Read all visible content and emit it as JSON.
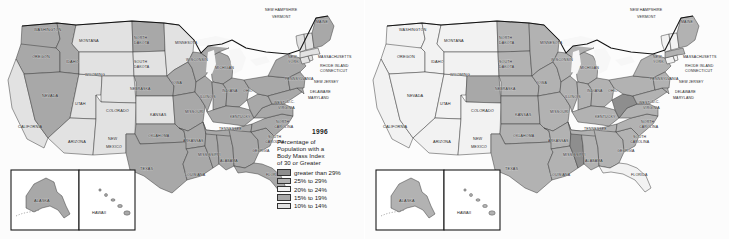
{
  "figure": {
    "panel_count": 2,
    "background_color": "#fdfdfd"
  },
  "palette": {
    "greater_than_29": "#8e8e8e",
    "p25_29": "#b2b2b2",
    "p20_24": "#f2f2f2",
    "p15_19": "#a8a8a8",
    "p10_14": "#e2e2e2",
    "ocean": "#fbfbfb",
    "lake": "#f7f7f7",
    "border": "#3a3a3a",
    "outline": "#141414",
    "text": "#1b1b1b"
  },
  "legend": {
    "title_prefix": "Percentage of",
    "description_lines": [
      "Percentage of",
      "Population with a",
      "Body Mass Index",
      "of 30 or Greater"
    ],
    "rows": [
      {
        "label": "greater than 29%",
        "color": "#8e8e8e",
        "key": "greater_than_29"
      },
      {
        "label": "25% to 29%",
        "color": "#b2b2b2",
        "key": "p25_29"
      },
      {
        "label": "20% to 24%",
        "color": "#f2f2f2",
        "key": "p20_24"
      },
      {
        "label": "15% to 19%",
        "color": "#a8a8a8",
        "key": "p15_19"
      },
      {
        "label": "10% to 14%",
        "color": "#e2e2e2",
        "key": "p10_14"
      }
    ]
  },
  "maps": [
    {
      "id": "map-1996",
      "year": "1996",
      "position": "left",
      "inset_labels": {
        "alaska": "ALASKA",
        "hawaii": "HAWAII"
      }
    },
    {
      "id": "map-2006",
      "year": "2006",
      "position": "right",
      "inset_labels": {
        "alaska": "ALASKA",
        "hawaii": "HAWAII"
      }
    }
  ],
  "chart_data": {
    "type": "heatmap",
    "title": "Percentage of Population with a Body Mass Index of 30 or Greater",
    "subtitle": "United States choropleth maps, 1996 and 2006",
    "xlabel": "",
    "ylabel": "",
    "legend_position": "right",
    "grid": false,
    "categories": [
      "greater than 29%",
      "25% to 29%",
      "20% to 24%",
      "15% to 19%",
      "10% to 14%"
    ],
    "series": [
      {
        "name": "1996",
        "values": {
          "WASHINGTON": "15% to 19%",
          "OREGON": "15% to 19%",
          "CALIFORNIA": "10% to 14%",
          "IDAHO": "15% to 19%",
          "NEVADA": "15% to 19%",
          "UTAH": "10% to 14%",
          "ARIZONA": "10% to 14%",
          "MONTANA": "10% to 14%",
          "WYOMING": "10% to 14%",
          "COLORADO": "10% to 14%",
          "NEW MEXICO": "10% to 14%",
          "NORTH DAKOTA": "15% to 19%",
          "SOUTH DAKOTA": "10% to 14%",
          "NEBRASKA": "15% to 19%",
          "KANSAS": "10% to 14%",
          "OKLAHOMA": "15% to 19%",
          "TEXAS": "15% to 19%",
          "MINNESOTA": "10% to 14%",
          "IOWA": "15% to 19%",
          "MISSOURI": "15% to 19%",
          "ARKANSAS": "15% to 19%",
          "LOUISIANA": "15% to 19%",
          "WISCONSIN": "15% to 19%",
          "ILLINOIS": "15% to 19%",
          "MICHIGAN": "15% to 19%",
          "INDIANA": "15% to 19%",
          "OHIO": "15% to 19%",
          "KENTUCKY": "15% to 19%",
          "TENNESSEE": "15% to 19%",
          "MISSISSIPPI": "15% to 19%",
          "ALABAMA": "15% to 19%",
          "GEORGIA": "15% to 19%",
          "FLORIDA": "15% to 19%",
          "SOUTH CAROLINA": "15% to 19%",
          "NORTH CAROLINA": "15% to 19%",
          "VIRGINIA": "15% to 19%",
          "WEST VIRGINIA": "15% to 19%",
          "MARYLAND": "15% to 19%",
          "DELAWARE": "15% to 19%",
          "PENNSYLVANIA": "15% to 19%",
          "NEW JERSEY": "15% to 19%",
          "NEW YORK": "15% to 19%",
          "CONNECTICUT": "10% to 14%",
          "RHODE ISLAND": "10% to 14%",
          "MASSACHUSETTS": "10% to 14%",
          "VERMONT": "10% to 14%",
          "NEW HAMPSHIRE": "10% to 14%",
          "MAINE": "15% to 19%",
          "ALASKA": "15% to 19%",
          "HAWAII": "10% to 14%"
        }
      },
      {
        "name": "2006",
        "values": {
          "WASHINGTON": "20% to 24%",
          "OREGON": "20% to 24%",
          "CALIFORNIA": "20% to 24%",
          "IDAHO": "20% to 24%",
          "NEVADA": "20% to 24%",
          "UTAH": "20% to 24%",
          "ARIZONA": "20% to 24%",
          "MONTANA": "20% to 24%",
          "WYOMING": "20% to 24%",
          "COLORADO": "15% to 19%",
          "NEW MEXICO": "20% to 24%",
          "NORTH DAKOTA": "25% to 29%",
          "SOUTH DAKOTA": "25% to 29%",
          "NEBRASKA": "25% to 29%",
          "KANSAS": "25% to 29%",
          "OKLAHOMA": "25% to 29%",
          "TEXAS": "25% to 29%",
          "MINNESOTA": "25% to 29%",
          "IOWA": "25% to 29%",
          "MISSOURI": "25% to 29%",
          "ARKANSAS": "25% to 29%",
          "LOUISIANA": "25% to 29%",
          "WISCONSIN": "25% to 29%",
          "ILLINOIS": "25% to 29%",
          "MICHIGAN": "25% to 29%",
          "INDIANA": "25% to 29%",
          "OHIO": "25% to 29%",
          "KENTUCKY": "25% to 29%",
          "TENNESSEE": "25% to 29%",
          "MISSISSIPPI": "greater than 29%",
          "ALABAMA": "25% to 29%",
          "GEORGIA": "25% to 29%",
          "FLORIDA": "20% to 24%",
          "SOUTH CAROLINA": "25% to 29%",
          "NORTH CAROLINA": "25% to 29%",
          "VIRGINIA": "25% to 29%",
          "WEST VIRGINIA": "greater than 29%",
          "MARYLAND": "25% to 29%",
          "DELAWARE": "25% to 29%",
          "PENNSYLVANIA": "25% to 29%",
          "NEW JERSEY": "25% to 29%",
          "NEW YORK": "25% to 29%",
          "CONNECTICUT": "20% to 24%",
          "RHODE ISLAND": "20% to 24%",
          "MASSACHUSETTS": "25% to 29%",
          "VERMONT": "20% to 24%",
          "NEW HAMPSHIRE": "20% to 24%",
          "MAINE": "25% to 29%",
          "ALASKA": "25% to 29%",
          "HAWAII": "20% to 24%"
        }
      }
    ]
  },
  "state_labels": [
    {
      "name": "WASHINGTON",
      "x": 34,
      "y": 31,
      "size": "mid"
    },
    {
      "name": "MONTANA",
      "x": 79,
      "y": 42,
      "size": "mid"
    },
    {
      "name": "NORTH",
      "x": 134,
      "y": 39,
      "size": "tiny"
    },
    {
      "name": "DAKOTA",
      "x": 134,
      "y": 44,
      "size": "tiny"
    },
    {
      "name": "MINNESOTA",
      "x": 175,
      "y": 44,
      "size": "tiny"
    },
    {
      "name": "OREGON",
      "x": 32,
      "y": 58,
      "size": "mid"
    },
    {
      "name": "IDAHO",
      "x": 66,
      "y": 63,
      "size": "mid"
    },
    {
      "name": "WYOMING",
      "x": 85,
      "y": 76,
      "size": "mid"
    },
    {
      "name": "SOUTH",
      "x": 134,
      "y": 63,
      "size": "tiny"
    },
    {
      "name": "DAKOTA",
      "x": 134,
      "y": 68,
      "size": "tiny"
    },
    {
      "name": "WISCONSIN",
      "x": 186,
      "y": 61,
      "size": "tiny"
    },
    {
      "name": "MICHIGAN",
      "x": 215,
      "y": 69,
      "size": "tiny"
    },
    {
      "name": "NEW",
      "x": 288,
      "y": 58,
      "size": "tiny"
    },
    {
      "name": "YORK",
      "x": 288,
      "y": 63,
      "size": "tiny"
    },
    {
      "name": "MASSACHUSETTS",
      "x": 318,
      "y": 58,
      "size": "tiny"
    },
    {
      "name": "RHODE ISLAND",
      "x": 320,
      "y": 67,
      "size": "tiny"
    },
    {
      "name": "CONNECTICUT",
      "x": 320,
      "y": 72,
      "size": "tiny"
    },
    {
      "name": "NEW HAMPSHIRE",
      "x": 265,
      "y": 11,
      "size": "tiny"
    },
    {
      "name": "VERMONT",
      "x": 272,
      "y": 18,
      "size": "tiny"
    },
    {
      "name": "MAINE",
      "x": 316,
      "y": 23,
      "size": "tiny"
    },
    {
      "name": "NEBRASKA",
      "x": 130,
      "y": 90,
      "size": "tiny"
    },
    {
      "name": "IOWA",
      "x": 172,
      "y": 84,
      "size": "tiny"
    },
    {
      "name": "PENNSYLVANIA",
      "x": 285,
      "y": 80,
      "size": "tiny"
    },
    {
      "name": "NEVADA",
      "x": 42,
      "y": 97,
      "size": "mid"
    },
    {
      "name": "UTAH",
      "x": 75,
      "y": 105,
      "size": "mid"
    },
    {
      "name": "COLORADO",
      "x": 106,
      "y": 112,
      "size": "mid"
    },
    {
      "name": "KANSAS",
      "x": 150,
      "y": 116,
      "size": "mid"
    },
    {
      "name": "MISSOURI",
      "x": 185,
      "y": 113,
      "size": "tiny"
    },
    {
      "name": "ILLINOIS",
      "x": 200,
      "y": 98,
      "size": "tiny"
    },
    {
      "name": "INDIANA",
      "x": 222,
      "y": 92,
      "size": "tiny"
    },
    {
      "name": "OHIO",
      "x": 243,
      "y": 92,
      "size": "tiny"
    },
    {
      "name": "NEW JERSEY",
      "x": 314,
      "y": 83,
      "size": "tiny"
    },
    {
      "name": "DELAWARE",
      "x": 310,
      "y": 93,
      "size": "tiny"
    },
    {
      "name": "MARYLAND",
      "x": 308,
      "y": 99,
      "size": "tiny"
    },
    {
      "name": "D.C.",
      "x": 287,
      "y": 103,
      "size": "tiny"
    },
    {
      "name": "WEST",
      "x": 274,
      "y": 104,
      "size": "tiny"
    },
    {
      "name": "VIRGINIA",
      "x": 278,
      "y": 109,
      "size": "tiny"
    },
    {
      "name": "CALIFORNIA",
      "x": 18,
      "y": 128,
      "size": "mid"
    },
    {
      "name": "ARIZONA",
      "x": 68,
      "y": 143,
      "size": "mid"
    },
    {
      "name": "NEW",
      "x": 108,
      "y": 140,
      "size": "mid"
    },
    {
      "name": "MEXICO",
      "x": 106,
      "y": 148,
      "size": "mid"
    },
    {
      "name": "OKLAHOMA",
      "x": 148,
      "y": 137,
      "size": "tiny"
    },
    {
      "name": "ARKANSAS",
      "x": 183,
      "y": 142,
      "size": "tiny"
    },
    {
      "name": "TENNESSEE",
      "x": 219,
      "y": 130,
      "size": "tiny"
    },
    {
      "name": "KENTUCKY",
      "x": 230,
      "y": 118,
      "size": "tiny"
    },
    {
      "name": "NORTH",
      "x": 276,
      "y": 123,
      "size": "tiny"
    },
    {
      "name": "CAROLINA",
      "x": 274,
      "y": 128,
      "size": "tiny"
    },
    {
      "name": "SOUTH",
      "x": 268,
      "y": 138,
      "size": "tiny"
    },
    {
      "name": "CAROLINA",
      "x": 265,
      "y": 143,
      "size": "tiny"
    },
    {
      "name": "GEORGIA",
      "x": 252,
      "y": 152,
      "size": "tiny"
    },
    {
      "name": "MISSISSIPPI",
      "x": 198,
      "y": 156,
      "size": "tiny"
    },
    {
      "name": "ALABAMA",
      "x": 220,
      "y": 162,
      "size": "tiny"
    },
    {
      "name": "TEXAS",
      "x": 140,
      "y": 170,
      "size": "mid"
    },
    {
      "name": "LOUISIANA",
      "x": 185,
      "y": 176,
      "size": "tiny"
    },
    {
      "name": "FLORIDA",
      "x": 266,
      "y": 176,
      "size": "tiny"
    }
  ],
  "inset": {
    "alaska_label": "ALASKA",
    "hawaii_label": "HAWAII"
  }
}
